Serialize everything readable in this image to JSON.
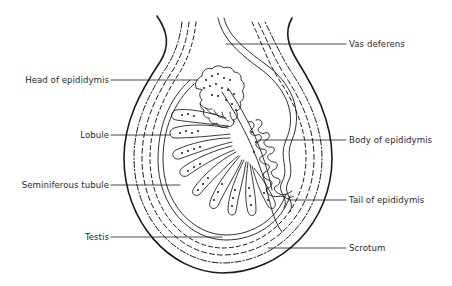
{
  "figure": {
    "colors": {
      "ink": "#1a1a1a",
      "background": "#ffffff"
    }
  },
  "labels": {
    "left": [
      {
        "id": "head-of-epididymis",
        "text": "Head of epididymis"
      },
      {
        "id": "lobule",
        "text": "Lobule"
      },
      {
        "id": "seminiferous-tubule",
        "text": "Seminiferous tubule"
      },
      {
        "id": "testis",
        "text": "Testis"
      }
    ],
    "right": [
      {
        "id": "vas-deferens",
        "text": "Vas deferens"
      },
      {
        "id": "body-of-epididymis",
        "text": "Body of epididymis"
      },
      {
        "id": "tail-of-epididymis",
        "text": "Tail of epididymis"
      },
      {
        "id": "scrotum",
        "text": "Scrotum"
      }
    ]
  }
}
